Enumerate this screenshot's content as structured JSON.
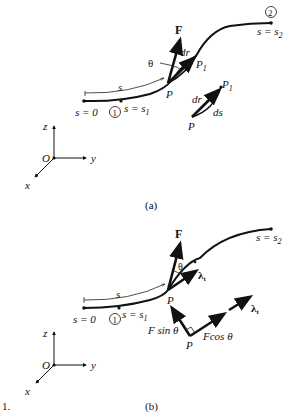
{
  "figure_number": "1.",
  "panels": [
    {
      "id": "a",
      "caption": "(a)",
      "labels": {
        "start": "s = 0",
        "point1_marker": "1",
        "point1": "s = s",
        "point1_sub": "1",
        "point2_marker": "2",
        "point2": "s = s",
        "point2_sub": "2",
        "arc_length": "s",
        "force": "F",
        "angle": "θ",
        "dr": "dr",
        "point_P": "P",
        "point_P1": "P",
        "point_P1_sub": "1",
        "inset_dr": "dr",
        "inset_ds": "ds",
        "inset_P": "P",
        "inset_P1": "P",
        "inset_P1_sub": "1"
      },
      "axes": {
        "origin": "O",
        "x": "x",
        "y": "y",
        "z": "z"
      }
    },
    {
      "id": "b",
      "caption": "(b)",
      "labels": {
        "start": "s = 0",
        "point1_marker": "1",
        "point1": "s = s",
        "point1_sub": "1",
        "point2": "s = s",
        "point2_sub": "2",
        "arc_length": "s",
        "force": "F",
        "angle": "θ",
        "tangent": "λ",
        "tangent_sub": "t",
        "point_P": "P",
        "normal_component": "F sin θ",
        "tangential_component": "Fcos θ",
        "decomp_P": "P",
        "decomp_tangent": "λ",
        "decomp_tangent_sub": "t"
      },
      "axes": {
        "origin": "O",
        "x": "x",
        "y": "y",
        "z": "z"
      }
    }
  ]
}
